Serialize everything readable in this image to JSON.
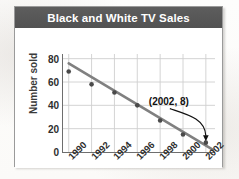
{
  "card": {
    "title": "Black and White TV Sales"
  },
  "chart_data": {
    "type": "scatter",
    "title": "Black and White TV Sales",
    "xlabel": "",
    "ylabel": "Number sold",
    "categories": [
      "1990",
      "1992",
      "1994",
      "1996",
      "1998",
      "2000",
      "2002"
    ],
    "x": [
      1990,
      1992,
      1994,
      1996,
      1998,
      2000,
      2002
    ],
    "values": [
      69,
      58,
      51,
      40,
      27,
      15,
      8
    ],
    "series": [
      {
        "name": "Number sold",
        "values": [
          69,
          58,
          51,
          40,
          27,
          15,
          8
        ]
      }
    ],
    "trendline": {
      "type": "line",
      "start": {
        "x": 1990,
        "y": 76
      },
      "end": {
        "x": 2002.6,
        "y": 2
      },
      "color": "#808080"
    },
    "xlim": [
      1989.5,
      2002.8
    ],
    "ylim": [
      0,
      84
    ],
    "yticks": [
      0,
      20,
      40,
      60,
      80
    ],
    "ytick_labels": [
      "0",
      "20",
      "40",
      "60",
      "80"
    ],
    "xticks": [
      1990,
      1992,
      1994,
      1996,
      1998,
      2000,
      2002
    ],
    "xtick_labels": [
      "1990",
      "1992",
      "1994",
      "1996",
      "1998",
      "2000",
      "2002"
    ],
    "xtick_rotation": -45,
    "grid": true,
    "grid_color": "#cfcfcf",
    "legend": false,
    "legend_position": "none",
    "marker_color": "#4a4a4a",
    "annotations": [
      {
        "text": "(2002, 8)",
        "points_to_x": 2002,
        "points_to_y": 8,
        "arrow": "curved"
      }
    ]
  },
  "colors": {
    "header_bg": "#575757",
    "header_text": "#ffffff",
    "card_bg": "#ffffff",
    "card_border": "#9a9a9a",
    "axis": "#6e6e6e",
    "grid": "#cfcfcf",
    "trendline": "#808080",
    "marker": "#4a4a4a",
    "tick_text": "#2e2e2e",
    "annotation_text": "#111111"
  }
}
